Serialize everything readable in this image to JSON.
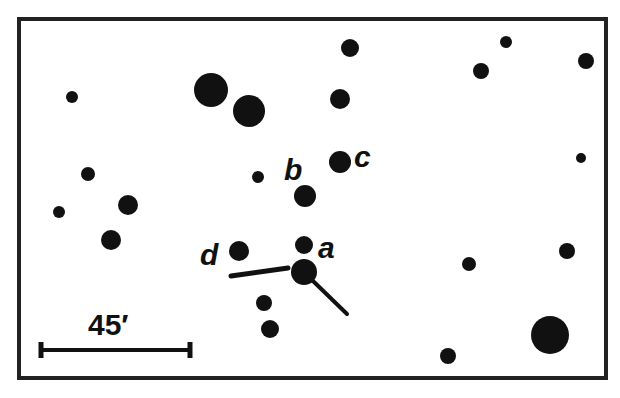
{
  "figure": {
    "type": "star-field finder chart",
    "frame": {
      "x": 19,
      "y": 19,
      "width": 587,
      "height": 359,
      "stroke": "#222222",
      "stroke_width": 4
    },
    "ink_color": "#111111",
    "background": "#ffffff"
  },
  "stars": [
    {
      "x": 72,
      "y": 97,
      "r": 6
    },
    {
      "x": 211,
      "y": 90,
      "r": 17
    },
    {
      "x": 249,
      "y": 111,
      "r": 16
    },
    {
      "x": 350,
      "y": 48,
      "r": 9
    },
    {
      "x": 340,
      "y": 99,
      "r": 10
    },
    {
      "x": 481,
      "y": 71,
      "r": 8
    },
    {
      "x": 506,
      "y": 42,
      "r": 6
    },
    {
      "x": 586,
      "y": 61,
      "r": 8
    },
    {
      "x": 581,
      "y": 158,
      "r": 5
    },
    {
      "x": 88,
      "y": 174,
      "r": 7
    },
    {
      "x": 258,
      "y": 177,
      "r": 6
    },
    {
      "x": 340,
      "y": 162,
      "r": 11
    },
    {
      "x": 305,
      "y": 196,
      "r": 11
    },
    {
      "x": 128,
      "y": 205,
      "r": 10
    },
    {
      "x": 59,
      "y": 212,
      "r": 6
    },
    {
      "x": 111,
      "y": 240,
      "r": 10
    },
    {
      "x": 239,
      "y": 251,
      "r": 10
    },
    {
      "x": 304,
      "y": 245,
      "r": 9
    },
    {
      "x": 304,
      "y": 272,
      "r": 13
    },
    {
      "x": 264,
      "y": 303,
      "r": 8
    },
    {
      "x": 270,
      "y": 329,
      "r": 9
    },
    {
      "x": 469,
      "y": 264,
      "r": 7
    },
    {
      "x": 567,
      "y": 251,
      "r": 8
    },
    {
      "x": 550,
      "y": 335,
      "r": 19
    },
    {
      "x": 448,
      "y": 356,
      "r": 8
    }
  ],
  "labels": [
    {
      "text": "a",
      "x": 318,
      "y": 258,
      "size": 30
    },
    {
      "text": "b",
      "x": 284,
      "y": 180,
      "size": 30
    },
    {
      "text": "c",
      "x": 354,
      "y": 167,
      "size": 30
    },
    {
      "text": "d",
      "x": 200,
      "y": 265,
      "size": 30
    }
  ],
  "pointer_lines": [
    {
      "x1": 231,
      "y1": 276,
      "x2": 288,
      "y2": 268,
      "width": 5
    },
    {
      "x1": 312,
      "y1": 280,
      "x2": 347,
      "y2": 314,
      "width": 4
    }
  ],
  "scale_bar": {
    "label": "45′",
    "label_x": 88,
    "label_y": 335,
    "label_size": 30,
    "x1": 41,
    "x2": 190,
    "y": 350,
    "cap_height": 16,
    "line_width": 4
  }
}
